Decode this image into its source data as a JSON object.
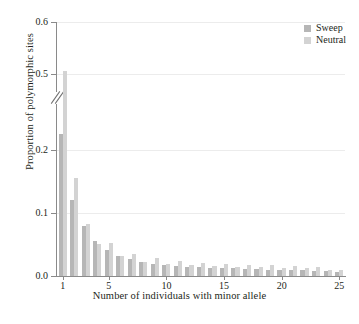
{
  "chart_data": {
    "type": "bar",
    "title": "",
    "subtitle": "",
    "xlabel": "Number of individuals with minor allele",
    "ylabel": "Proportion of polymorphic sites",
    "grid": true,
    "legend_position": "top-right",
    "xlim": [
      0.5,
      25.5
    ],
    "ylim": [
      0.0,
      0.6
    ],
    "y_axis_break": {
      "present": true,
      "from": 0.2,
      "to": 0.5
    },
    "yticks": [
      0.0,
      0.1,
      0.2,
      0.5,
      0.6
    ],
    "ytick_labels": [
      "0.0",
      "0.1",
      "0.2",
      "0.5",
      "0.6"
    ],
    "xticks": [
      1,
      5,
      10,
      15,
      20,
      25
    ],
    "xtick_labels": [
      "1",
      "5",
      "10",
      "15",
      "20",
      "25"
    ],
    "categories": [
      1,
      2,
      3,
      4,
      5,
      6,
      7,
      8,
      9,
      10,
      11,
      12,
      13,
      14,
      15,
      16,
      17,
      18,
      19,
      20,
      21,
      22,
      23,
      24,
      25
    ],
    "series": [
      {
        "name": "Sweep",
        "color": "#b6b6b6",
        "values": [
          0.33,
          0.12,
          0.079,
          0.055,
          0.041,
          0.031,
          0.027,
          0.022,
          0.019,
          0.018,
          0.016,
          0.015,
          0.014,
          0.013,
          0.012,
          0.012,
          0.011,
          0.011,
          0.01,
          0.01,
          0.009,
          0.009,
          0.008,
          0.008,
          0.007
        ]
      },
      {
        "name": "Neutral",
        "color": "#d3d3d3",
        "values": [
          0.505,
          0.155,
          0.082,
          0.051,
          0.052,
          0.031,
          0.035,
          0.023,
          0.028,
          0.019,
          0.024,
          0.017,
          0.021,
          0.016,
          0.019,
          0.015,
          0.018,
          0.014,
          0.017,
          0.013,
          0.016,
          0.012,
          0.014,
          0.01,
          0.009
        ]
      }
    ]
  },
  "legend": {
    "items": [
      {
        "label": "Sweep",
        "color": "#b6b6b6"
      },
      {
        "label": "Neutral",
        "color": "#d3d3d3"
      }
    ]
  }
}
